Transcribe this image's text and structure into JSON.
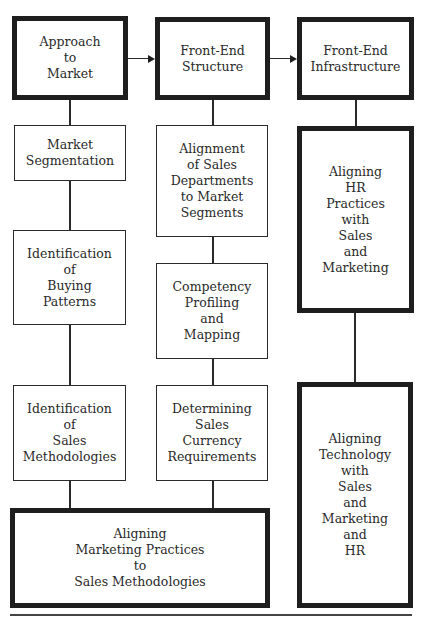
{
  "diagram": {
    "top_row": [
      {
        "id": "approach-to-market",
        "label": "Approach\nto\nMarket"
      },
      {
        "id": "front-end-structure",
        "label": "Front-End\nStructure"
      },
      {
        "id": "front-end-infrastructure",
        "label": "Front-End\nInfrastructure"
      }
    ],
    "column1": [
      {
        "id": "market-segmentation",
        "label": "Market\nSegmentation"
      },
      {
        "id": "identification-buying-patterns",
        "label": "Identification\nof\nBuying\nPatterns"
      },
      {
        "id": "identification-sales-methodologies",
        "label": "Identification\nof\nSales\nMethodologies"
      }
    ],
    "column2": [
      {
        "id": "alignment-sales-departments",
        "label": "Alignment\nof Sales\nDepartments\nto Market\nSegments"
      },
      {
        "id": "competency-profiling",
        "label": "Competency\nProfiling\nand\nMapping"
      },
      {
        "id": "determining-sales-currency",
        "label": "Determining\nSales\nCurrency\nRequirements"
      }
    ],
    "column3": [
      {
        "id": "aligning-hr-practices",
        "label": "Aligning\nHR\nPractices\nwith\nSales\nand\nMarketing"
      },
      {
        "id": "aligning-technology",
        "label": "Aligning\nTechnology\nwith\nSales\nand\nMarketing\nand\nHR"
      }
    ],
    "bottom": {
      "id": "aligning-marketing-practices",
      "label": "Aligning\nMarketing Practices\nto\nSales Methodologies"
    },
    "edges": [
      [
        "approach-to-market",
        "front-end-structure"
      ],
      [
        "front-end-structure",
        "front-end-infrastructure"
      ]
    ]
  }
}
